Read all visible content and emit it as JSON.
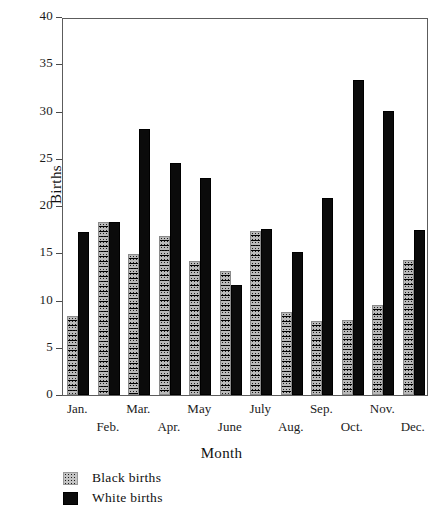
{
  "chart_data": {
    "type": "bar",
    "title": "",
    "xlabel": "Month",
    "ylabel": "Births",
    "ylim": [
      0,
      40
    ],
    "yticks": [
      0,
      5,
      10,
      15,
      20,
      25,
      30,
      35,
      40
    ],
    "grid": false,
    "legend_position": "below-left",
    "categories": [
      "Jan.",
      "Feb.",
      "Mar.",
      "Apr.",
      "May",
      "June",
      "July",
      "Aug.",
      "Sep.",
      "Oct.",
      "Nov.",
      "Dec."
    ],
    "series": [
      {
        "name": "Black births",
        "color": "#c4c4c4",
        "values": [
          8.4,
          18.3,
          14.9,
          16.8,
          14.2,
          13.1,
          17.4,
          8.8,
          7.8,
          7.9,
          9.5,
          14.3
        ]
      },
      {
        "name": "White births",
        "color": "#0b0b0b",
        "values": [
          17.3,
          18.3,
          28.2,
          24.5,
          23.0,
          11.6,
          17.6,
          15.1,
          20.8,
          33.3,
          30.1,
          17.5
        ]
      }
    ]
  },
  "axes": {
    "y_label": "Births",
    "x_label": "Month",
    "y_tick_labels": [
      "0",
      "5",
      "10",
      "15",
      "20",
      "25",
      "30",
      "35",
      "40"
    ]
  },
  "legend": {
    "items": [
      {
        "label": "Black births",
        "swatch": "stipple-swatch"
      },
      {
        "label": "White births",
        "swatch": "solid-black-swatch"
      }
    ]
  }
}
